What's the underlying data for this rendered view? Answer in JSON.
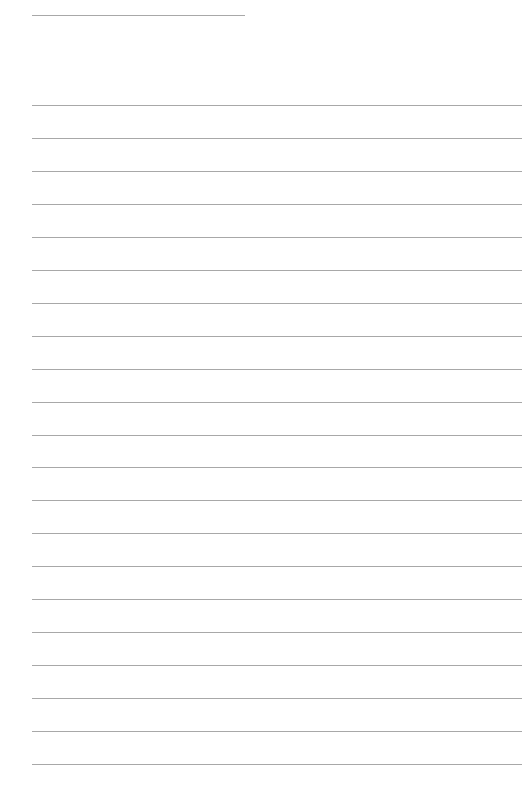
{
  "document": {
    "type": "lined-paper",
    "header_line": {
      "text": ""
    },
    "rule_color": "#a8a8a8",
    "background_color": "#ffffff",
    "lines": [
      {
        "text": ""
      },
      {
        "text": ""
      },
      {
        "text": ""
      },
      {
        "text": ""
      },
      {
        "text": ""
      },
      {
        "text": ""
      },
      {
        "text": ""
      },
      {
        "text": ""
      },
      {
        "text": ""
      },
      {
        "text": ""
      },
      {
        "text": ""
      },
      {
        "text": ""
      },
      {
        "text": ""
      },
      {
        "text": ""
      },
      {
        "text": ""
      },
      {
        "text": ""
      },
      {
        "text": ""
      },
      {
        "text": ""
      },
      {
        "text": ""
      },
      {
        "text": ""
      },
      {
        "text": ""
      }
    ]
  }
}
